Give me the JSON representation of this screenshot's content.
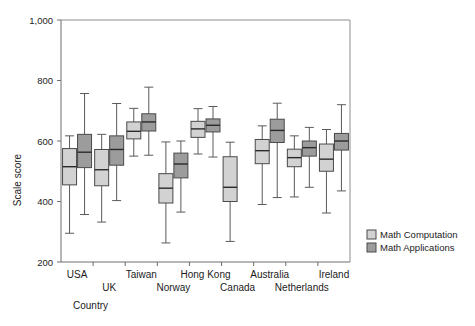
{
  "chart_data": {
    "type": "bar",
    "subtype": "box-plot",
    "title": "",
    "xlabel": "Country",
    "ylabel": "Scale score",
    "ylim": [
      200,
      1000
    ],
    "yticks": [
      200,
      400,
      600,
      800,
      1000
    ],
    "ytick_labels": [
      "200",
      "400",
      "600",
      "800",
      "1,000"
    ],
    "grid": false,
    "legend_position": "right",
    "categories": [
      "USA",
      "UK",
      "Taiwan",
      "Norway",
      "Hong Kong",
      "Canada",
      "Australia",
      "Netherlands",
      "Ireland"
    ],
    "category_label_rows": [
      0,
      1,
      0,
      1,
      0,
      1,
      0,
      1,
      0
    ],
    "series": [
      {
        "name": "Math Computation",
        "color": "#d2d2d2",
        "boxes": [
          {
            "category": "USA",
            "min": 295,
            "q1": 455,
            "median": 515,
            "q3": 575,
            "max": 617
          },
          {
            "category": "UK",
            "min": 332,
            "q1": 452,
            "median": 505,
            "q3": 572,
            "max": 622
          },
          {
            "category": "Taiwan",
            "min": 550,
            "q1": 607,
            "median": 632,
            "q3": 663,
            "max": 708
          },
          {
            "category": "Norway",
            "min": 263,
            "q1": 395,
            "median": 444,
            "q3": 492,
            "max": 597
          },
          {
            "category": "Hong Kong",
            "min": 557,
            "q1": 612,
            "median": 640,
            "q3": 665,
            "max": 707
          },
          {
            "category": "Canada",
            "min": 268,
            "q1": 400,
            "median": 447,
            "q3": 548,
            "max": 596
          },
          {
            "category": "Australia",
            "min": 390,
            "q1": 525,
            "median": 568,
            "q3": 605,
            "max": 650
          },
          {
            "category": "Netherlands",
            "min": 415,
            "q1": 515,
            "median": 545,
            "q3": 573,
            "max": 617
          },
          {
            "category": "Ireland",
            "min": 362,
            "q1": 500,
            "median": 540,
            "q3": 590,
            "max": 638
          }
        ]
      },
      {
        "name": "Math Applications",
        "color": "#9c9c9c",
        "boxes": [
          {
            "category": "USA",
            "min": 357,
            "q1": 512,
            "median": 563,
            "q3": 622,
            "max": 757
          },
          {
            "category": "UK",
            "min": 403,
            "q1": 520,
            "median": 572,
            "q3": 617,
            "max": 724
          },
          {
            "category": "Taiwan",
            "min": 553,
            "q1": 633,
            "median": 663,
            "q3": 690,
            "max": 778
          },
          {
            "category": "Norway",
            "min": 365,
            "q1": 478,
            "median": 524,
            "q3": 560,
            "max": 600
          },
          {
            "category": "Hong Kong",
            "min": 547,
            "q1": 630,
            "median": 652,
            "q3": 673,
            "max": 714
          },
          {
            "category": "Australia",
            "min": 413,
            "q1": 595,
            "median": 635,
            "q3": 672,
            "max": 725
          },
          {
            "category": "Netherlands",
            "min": 447,
            "q1": 550,
            "median": 578,
            "q3": 600,
            "max": 645
          },
          {
            "category": "Ireland",
            "min": 435,
            "q1": 570,
            "median": 600,
            "q3": 625,
            "max": 720
          }
        ]
      }
    ],
    "legend": [
      {
        "label": "Math Computation",
        "color": "#d2d2d2"
      },
      {
        "label": "Math Applications",
        "color": "#9c9c9c"
      }
    ]
  }
}
